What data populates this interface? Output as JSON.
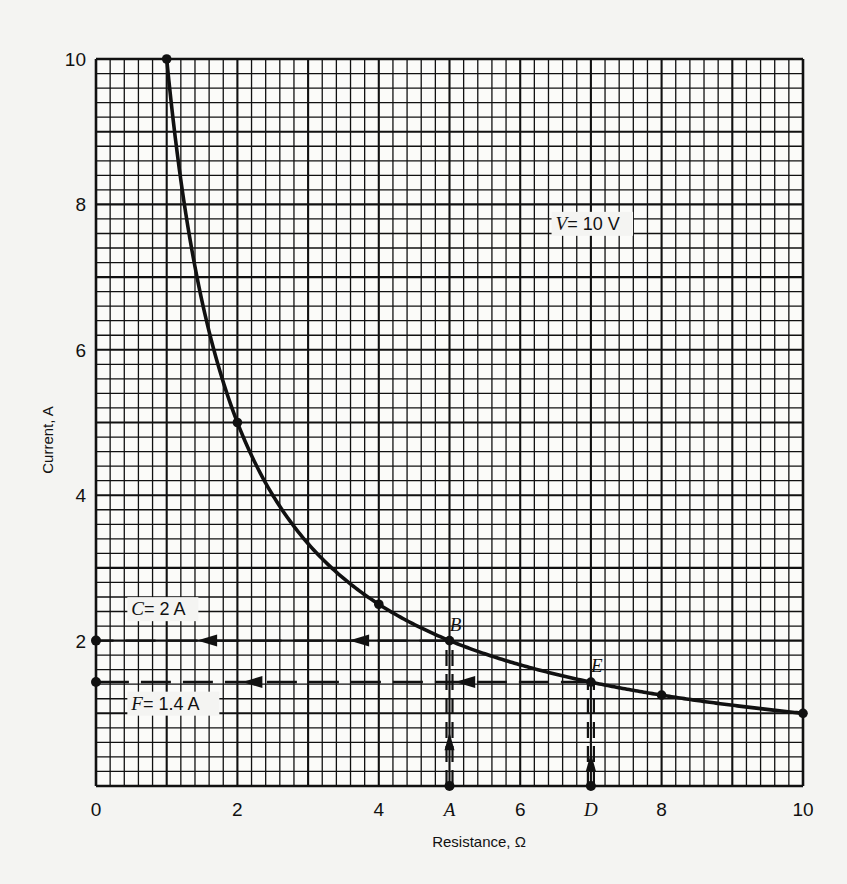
{
  "chart_data": {
    "type": "line",
    "title": "",
    "xlabel": "Resistance, Ω",
    "ylabel": "Current, A",
    "xlim": [
      0,
      10
    ],
    "ylim": [
      0,
      10
    ],
    "grid": true,
    "grid_minor_step": 0.2,
    "grid_major_step": 1,
    "x_ticks": [
      {
        "value": 0,
        "label": "0"
      },
      {
        "value": 2,
        "label": "2"
      },
      {
        "value": 4,
        "label": "4"
      },
      {
        "value": 5,
        "label": "A",
        "italic": true
      },
      {
        "value": 6,
        "label": "6"
      },
      {
        "value": 7,
        "label": "D",
        "italic": true
      },
      {
        "value": 8,
        "label": "8"
      },
      {
        "value": 10,
        "label": "10"
      }
    ],
    "y_ticks": [
      {
        "value": 2,
        "label": "2"
      },
      {
        "value": 4,
        "label": "4"
      },
      {
        "value": 6,
        "label": "6"
      },
      {
        "value": 8,
        "label": "8"
      },
      {
        "value": 10,
        "label": "10"
      }
    ],
    "series": [
      {
        "name": "V = 10 V",
        "equation": "I = 10 / R",
        "points": [
          {
            "x": 1,
            "y": 10
          },
          {
            "x": 2,
            "y": 5
          },
          {
            "x": 4,
            "y": 2.5
          },
          {
            "x": 5,
            "y": 2
          },
          {
            "x": 7,
            "y": 1.43
          },
          {
            "x": 8,
            "y": 1.25
          },
          {
            "x": 10,
            "y": 1
          }
        ]
      }
    ],
    "annotations": [
      {
        "id": "curve-label",
        "text_italic": "V",
        "text_rest": "= 10 V",
        "x": 6.5,
        "y": 7.65
      },
      {
        "id": "point-B",
        "text": "B",
        "x": 5,
        "y": 2
      },
      {
        "id": "point-E",
        "text": "E",
        "x": 7,
        "y": 1.43
      },
      {
        "id": "label-C",
        "text_italic": "C",
        "text_rest": "= 2 A",
        "x": 0.5,
        "y": 2.35
      },
      {
        "id": "label-F",
        "text_italic": "F",
        "text_rest": "= 1.4 A",
        "x": 0.5,
        "y": 1.05
      }
    ],
    "guide_lines": [
      {
        "from": [
          5,
          0
        ],
        "to": [
          5,
          2
        ],
        "style": "dashed",
        "arrow": "up"
      },
      {
        "from": [
          5,
          2
        ],
        "to": [
          0,
          2
        ],
        "style": "dashed",
        "arrow": "left"
      },
      {
        "from": [
          7,
          0
        ],
        "to": [
          7,
          1.43
        ],
        "style": "dashed",
        "arrow": "up"
      },
      {
        "from": [
          7,
          1.43
        ],
        "to": [
          0,
          1.43
        ],
        "style": "dashed",
        "arrow": "left"
      }
    ],
    "colors": {
      "background": "#f4f4f2",
      "ink": "#111111"
    }
  }
}
